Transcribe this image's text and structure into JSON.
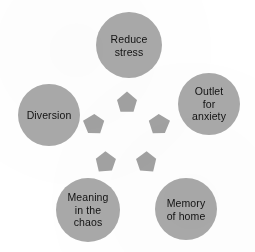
{
  "figure": {
    "type": "cycle-diagram",
    "background_color": "#ffffff",
    "node_fill_color": "#a9a9a9",
    "arrow_fill_color": "#a2a2a2",
    "text_color": "#121212",
    "node_count": 5,
    "arrow_count": 5
  },
  "nodes": [
    {
      "id": "reduce-stress",
      "label": "Reduce\nstress",
      "cx": 129,
      "cy": 45,
      "r": 33
    },
    {
      "id": "outlet-for-anxiety",
      "label": "Outlet\nfor\nanxiety",
      "cx": 209,
      "cy": 104,
      "r": 31
    },
    {
      "id": "memory-of-home",
      "label": "Memory\nof home",
      "cx": 186,
      "cy": 209,
      "r": 31
    },
    {
      "id": "meaning-in-the-chaos",
      "label": "Meaning\nin the\nchaos",
      "cx": 88,
      "cy": 210,
      "r": 32
    },
    {
      "id": "diversion",
      "label": "Diversion",
      "cx": 49,
      "cy": 115,
      "r": 31
    }
  ],
  "arrows": [
    {
      "id": "arrow-up",
      "cx": 127,
      "cy": 102,
      "rotation": 0,
      "size": 21
    },
    {
      "id": "arrow-upper-right",
      "cx": 160,
      "cy": 124,
      "rotation": 72,
      "size": 21
    },
    {
      "id": "arrow-lower-right",
      "cx": 147,
      "cy": 163,
      "rotation": 144,
      "size": 21
    },
    {
      "id": "arrow-lower-left",
      "cx": 105,
      "cy": 163,
      "rotation": 216,
      "size": 21
    },
    {
      "id": "arrow-upper-left",
      "cx": 93,
      "cy": 124,
      "rotation": 288,
      "size": 21
    }
  ]
}
